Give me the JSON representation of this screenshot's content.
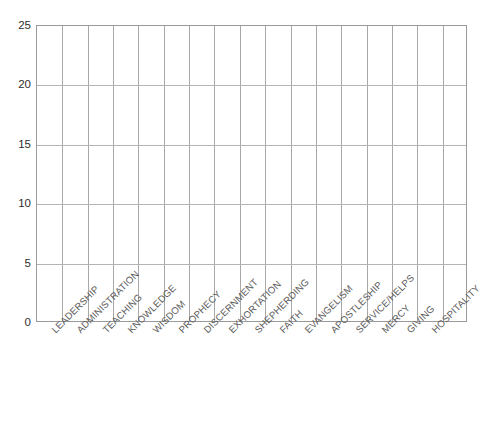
{
  "header": {
    "remnant_text": ""
  },
  "chart_data": {
    "type": "bar",
    "title": "",
    "subtitle": "",
    "xlabel": "",
    "ylabel": "",
    "ylim": [
      0,
      25
    ],
    "yticks": [
      0,
      5,
      10,
      15,
      20,
      25
    ],
    "ytick_labels": [
      "0",
      "5",
      "10",
      "15",
      "20",
      "25"
    ],
    "grid": true,
    "grid_vertical": true,
    "grid_horizontal": true,
    "legend": false,
    "legend_position": "none",
    "categories": [
      "LEADERSHIP",
      "ADMINISTRATION",
      "TEACHING",
      "KNOWLEDGE",
      "WISDOM",
      "PROPHECY",
      "DISCERNMENT",
      "EXHORTATION",
      "SHEPHERDING",
      "FAITH",
      "EVANGELISM",
      "APOSTLESHIP",
      "SERVICE/HELPS",
      "MERCY",
      "GIVING",
      "HOSPITALITY"
    ],
    "values": [
      0,
      0,
      0,
      0,
      0,
      0,
      0,
      0,
      0,
      0,
      0,
      0,
      0,
      0,
      0,
      0
    ],
    "column_count": 17,
    "annotations": []
  },
  "style": {
    "plot_border_color": "#9a9a9a",
    "vgrid_color": "#a8a8a8",
    "hgrid_color": "#b4b4b4",
    "ytick_text_color": "#2e2e2e",
    "xlabel_text_color": "#5a5a5a",
    "background": "#ffffff",
    "bar_color": "#ffffff"
  }
}
